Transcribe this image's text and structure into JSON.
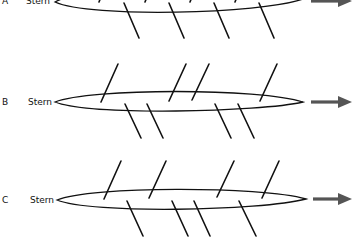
{
  "diagram": {
    "rows": [
      {
        "id": "A",
        "letter": "A",
        "label": "Stern",
        "oars_port_count": 4,
        "oars_starboard_count": 4,
        "direction": "right"
      },
      {
        "id": "B",
        "letter": "B",
        "label": "Stern",
        "oars_port_count": 4,
        "oars_starboard_count": 4,
        "direction": "right"
      },
      {
        "id": "C",
        "letter": "C",
        "label": "Stern",
        "oars_port_count": 4,
        "oars_starboard_count": 4,
        "direction": "right"
      }
    ]
  }
}
